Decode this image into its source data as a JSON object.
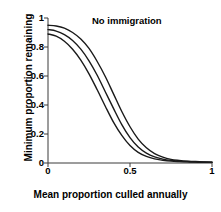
{
  "chart_data": {
    "type": "line",
    "title": "",
    "annotation": "No immigration",
    "xlabel": "Mean proportion culled annually",
    "ylabel": "Minimum proportion remaining",
    "xlim": [
      0,
      1
    ],
    "ylim": [
      0,
      1
    ],
    "grid": false,
    "legend": "none",
    "xticks": [
      "0",
      "0.5",
      "1"
    ],
    "xtick_values": [
      0,
      0.5,
      1
    ],
    "yticks": [
      "0",
      "0.2",
      "0.4",
      "0.6",
      "0.8",
      "1"
    ],
    "ytick_values": [
      0,
      0.2,
      0.4,
      0.6,
      0.8,
      1
    ],
    "line_color": "#1a1a1a",
    "x": [
      0,
      0.05,
      0.1,
      0.15,
      0.2,
      0.25,
      0.3,
      0.35,
      0.4,
      0.45,
      0.5,
      0.55,
      0.6,
      0.65,
      0.7,
      0.75,
      0.8,
      0.85,
      0.9,
      0.95,
      1
    ],
    "series": [
      {
        "name": "upper",
        "values": [
          0.95,
          0.945,
          0.93,
          0.9,
          0.855,
          0.79,
          0.7,
          0.595,
          0.475,
          0.355,
          0.25,
          0.165,
          0.105,
          0.065,
          0.04,
          0.025,
          0.018,
          0.013,
          0.01,
          0.008,
          0.006
        ]
      },
      {
        "name": "middle",
        "values": [
          0.92,
          0.91,
          0.885,
          0.845,
          0.785,
          0.705,
          0.605,
          0.49,
          0.375,
          0.265,
          0.175,
          0.11,
          0.068,
          0.042,
          0.027,
          0.018,
          0.013,
          0.01,
          0.008,
          0.006,
          0.005
        ]
      },
      {
        "name": "lower",
        "values": [
          0.89,
          0.875,
          0.84,
          0.785,
          0.71,
          0.615,
          0.505,
          0.39,
          0.28,
          0.19,
          0.12,
          0.073,
          0.045,
          0.028,
          0.019,
          0.013,
          0.01,
          0.008,
          0.006,
          0.005,
          0.004
        ]
      }
    ]
  }
}
